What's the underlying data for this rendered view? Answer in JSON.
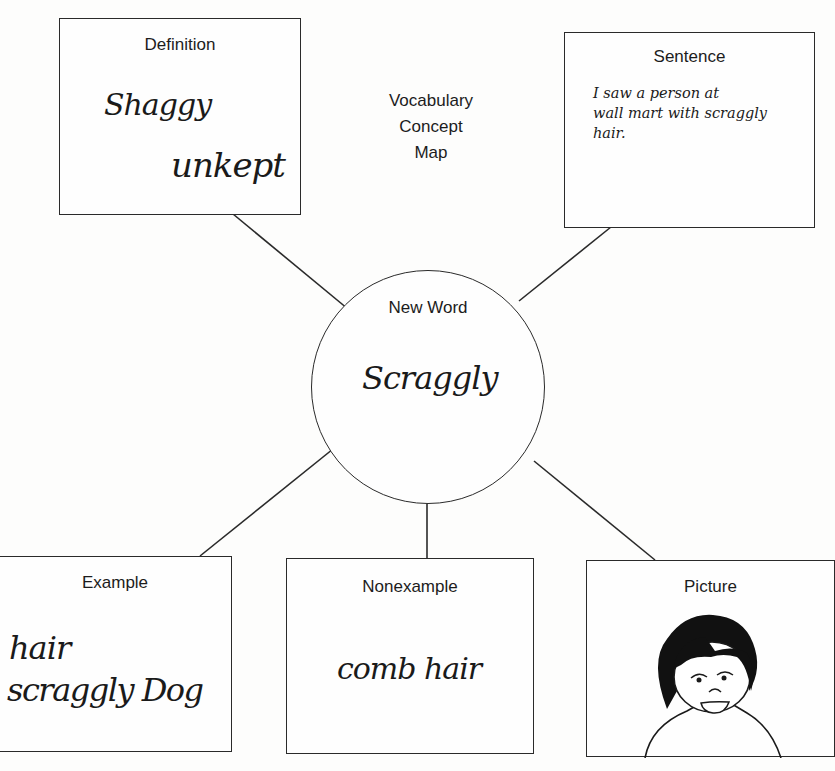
{
  "title": {
    "line1": "Vocabulary",
    "line2": "Concept",
    "line3": "Map"
  },
  "center": {
    "label": "New Word",
    "value": "Scraggly"
  },
  "definition": {
    "label": "Definition",
    "line1": "Shaggy",
    "line2": "unkept"
  },
  "sentence": {
    "label": "Sentence",
    "text": "I saw a person at\nwall mart with scraggly\nhair."
  },
  "example": {
    "label": "Example",
    "line1": "hair",
    "line2": "scraggly Dog"
  },
  "nonexample": {
    "label": "Nonexample",
    "value": "comb hair"
  },
  "picture": {
    "label": "Picture",
    "image": "face-with-dark-hair-drawing"
  },
  "colors": {
    "line": "#2a2a2a",
    "background": "#fdfdfc",
    "ink": "#1a1a1a"
  }
}
